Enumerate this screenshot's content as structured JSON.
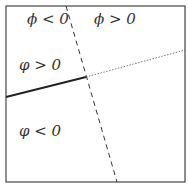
{
  "regions": [
    {
      "id": "top-left",
      "label": "ϕ < 0"
    },
    {
      "id": "top-right",
      "label": "ϕ > 0"
    },
    {
      "id": "mid-left",
      "label": "φ > 0"
    },
    {
      "id": "bottom-left",
      "label": "φ < 0"
    }
  ],
  "lines": {
    "dashed": {
      "x1": 66,
      "y1": 6,
      "x2": 117,
      "y2": 182
    },
    "solid": {
      "x1": 6,
      "y1": 97,
      "x2": 86,
      "y2": 77
    },
    "dotted": {
      "x1": 86,
      "y1": 77,
      "x2": 185,
      "y2": 50
    }
  },
  "colors": {
    "stroke": "#333333",
    "box": "#444444"
  }
}
